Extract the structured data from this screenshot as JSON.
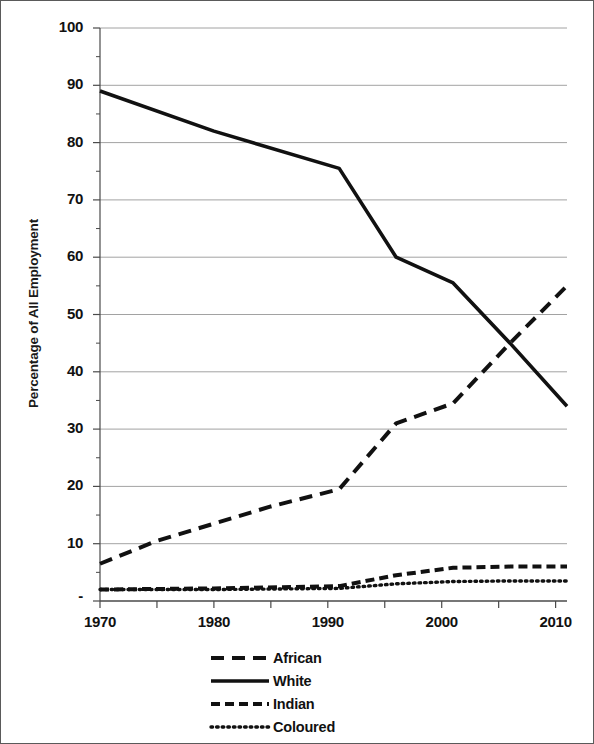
{
  "chart_data": {
    "type": "line",
    "title": "",
    "xlabel": "",
    "ylabel": "Percentage of All Employment",
    "xlim": [
      1970,
      2011
    ],
    "ylim": [
      0,
      100
    ],
    "ytick_labels": [
      "100",
      "90",
      "80",
      "70",
      "60",
      "50",
      "40",
      "30",
      "20",
      "10",
      "-"
    ],
    "ytick_values": [
      100,
      90,
      80,
      70,
      60,
      50,
      40,
      30,
      20,
      10,
      0
    ],
    "xtick_labels": [
      "1970",
      "1980",
      "1990",
      "2000",
      "2010"
    ],
    "xtick_values": [
      1970,
      1980,
      1990,
      2000,
      2010
    ],
    "minor_xtick_values": [
      1975,
      1985,
      1995,
      2005
    ],
    "grid": "horizontal",
    "legend_position": "bottom-center",
    "series": [
      {
        "name": "African",
        "style": "long-dash",
        "x": [
          1970,
          1975,
          1980,
          1985,
          1991,
          1996,
          2001,
          2006,
          2011
        ],
        "values": [
          6.5,
          10.5,
          13.5,
          16.5,
          19.5,
          31.0,
          34.5,
          45.0,
          55.0
        ]
      },
      {
        "name": "White",
        "style": "solid",
        "x": [
          1970,
          1980,
          1991,
          1996,
          2001,
          2006,
          2011
        ],
        "values": [
          89.0,
          82.0,
          75.5,
          60.0,
          55.5,
          45.0,
          34.0
        ]
      },
      {
        "name": "Indian",
        "style": "short-dash",
        "x": [
          1970,
          1980,
          1991,
          1996,
          2001,
          2006,
          2011
        ],
        "values": [
          2.0,
          2.2,
          2.6,
          4.5,
          5.8,
          6.0,
          6.0
        ]
      },
      {
        "name": "Coloured",
        "style": "dotted",
        "x": [
          1970,
          1980,
          1991,
          1996,
          2001,
          2006,
          2011
        ],
        "values": [
          2.0,
          2.0,
          2.2,
          3.0,
          3.4,
          3.5,
          3.5
        ]
      }
    ]
  },
  "legend": {
    "items": [
      {
        "label": "African",
        "style": "long-dash"
      },
      {
        "label": "White",
        "style": "solid"
      },
      {
        "label": "Indian",
        "style": "short-dash"
      },
      {
        "label": "Coloured",
        "style": "dotted"
      }
    ]
  },
  "colors": {
    "line": "#111111",
    "grid": "#8a8a8a",
    "axis": "#4a4a4a",
    "background": "#ffffff"
  }
}
